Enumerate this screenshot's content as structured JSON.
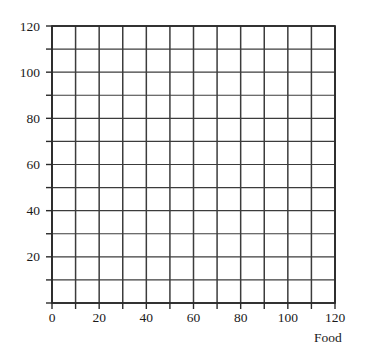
{
  "chart_data": {
    "type": "scatter",
    "title": "",
    "subtitle": "",
    "xlabel": "Food",
    "ylabel": "",
    "xlim": [
      0,
      120
    ],
    "ylim": [
      0,
      120
    ],
    "grid": true,
    "grid_step": 10,
    "legend": null,
    "series": [],
    "x_ticks": [
      0,
      20,
      40,
      60,
      80,
      100,
      120
    ],
    "y_ticks": [
      20,
      40,
      60,
      80,
      100,
      120
    ],
    "x_tick_labels": [
      "0",
      "20",
      "40",
      "60",
      "80",
      "100",
      "120"
    ],
    "y_tick_labels": [
      "20",
      "40",
      "60",
      "80",
      "100",
      "120"
    ],
    "minor_tick_step": 10,
    "annotations": [],
    "note": "Empty coordinate grid for plotting; no data points drawn."
  },
  "axes": {
    "x": {
      "label": "Food",
      "min": 0,
      "max": 120,
      "ticks": [
        {
          "value": 0,
          "label": "0"
        },
        {
          "value": 20,
          "label": "20"
        },
        {
          "value": 40,
          "label": "40"
        },
        {
          "value": 60,
          "label": "60"
        },
        {
          "value": 80,
          "label": "80"
        },
        {
          "value": 100,
          "label": "100"
        },
        {
          "value": 120,
          "label": "120"
        }
      ]
    },
    "y": {
      "label": "",
      "min": 0,
      "max": 120,
      "ticks": [
        {
          "value": 20,
          "label": "20"
        },
        {
          "value": 40,
          "label": "40"
        },
        {
          "value": 60,
          "label": "60"
        },
        {
          "value": 80,
          "label": "80"
        },
        {
          "value": 100,
          "label": "100"
        },
        {
          "value": 120,
          "label": "120"
        }
      ]
    }
  },
  "colors": {
    "background": "#ffffff",
    "grid_line": "#3c3c3c",
    "frame_line": "#2b2b2b",
    "text": "#1a1a1a"
  },
  "geometry": {
    "plot_left": 52,
    "plot_top": 26,
    "plot_right": 335,
    "plot_bottom": 303,
    "columns": 12,
    "rows": 12
  }
}
